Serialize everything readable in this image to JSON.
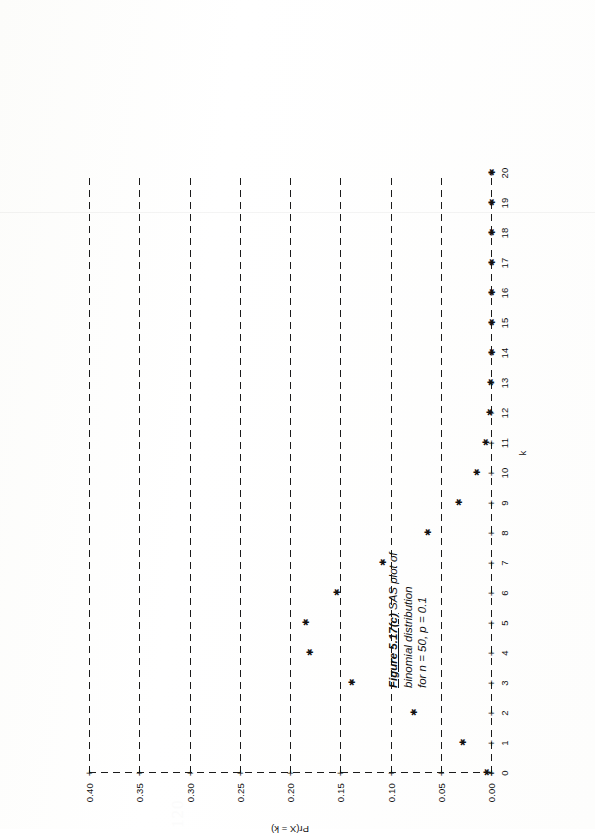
{
  "document": {
    "page_number": "120",
    "figure_label": "Figure 5.17(c)",
    "caption_lines": [
      "SAS plot of",
      "binomial distribution",
      "for n = 50, p = 0.1"
    ]
  },
  "chart_data": {
    "type": "scatter",
    "title": "",
    "xlabel": "k",
    "ylabel": "Pr(X = k)",
    "xlim": [
      0,
      20
    ],
    "ylim": [
      0.0,
      0.4
    ],
    "grid": false,
    "legend": "none",
    "marker": "*",
    "x_ticks": [
      "0",
      "1",
      "2",
      "3",
      "4",
      "5",
      "6",
      "7",
      "8",
      "9",
      "10",
      "11",
      "12",
      "13",
      "14",
      "15",
      "16",
      "17",
      "18",
      "19",
      "20"
    ],
    "y_ticks": [
      "0.00",
      "0.05",
      "0.10",
      "0.15",
      "0.20",
      "0.25",
      "0.30",
      "0.35",
      "0.40"
    ],
    "categories": [
      0,
      1,
      2,
      3,
      4,
      5,
      6,
      7,
      8,
      9,
      10,
      11,
      12,
      13,
      14,
      15,
      16,
      17,
      18,
      19,
      20
    ],
    "values": [
      0.005,
      0.029,
      0.078,
      0.139,
      0.181,
      0.185,
      0.154,
      0.108,
      0.064,
      0.033,
      0.015,
      0.006,
      0.002,
      0.001,
      0.0,
      0.0,
      0.0,
      0.0,
      0.0,
      0.0,
      0.0
    ],
    "series": [
      {
        "name": "Pr(X = k), n = 50, p = 0.1",
        "values": [
          0.005,
          0.029,
          0.078,
          0.139,
          0.181,
          0.185,
          0.154,
          0.108,
          0.064,
          0.033,
          0.015,
          0.006,
          0.002,
          0.001,
          0.0,
          0.0,
          0.0,
          0.0,
          0.0,
          0.0,
          0.0
        ]
      }
    ]
  },
  "colors": {
    "ink": "#111111",
    "paper": "#ffffff",
    "folio": "#fbfbfb"
  }
}
